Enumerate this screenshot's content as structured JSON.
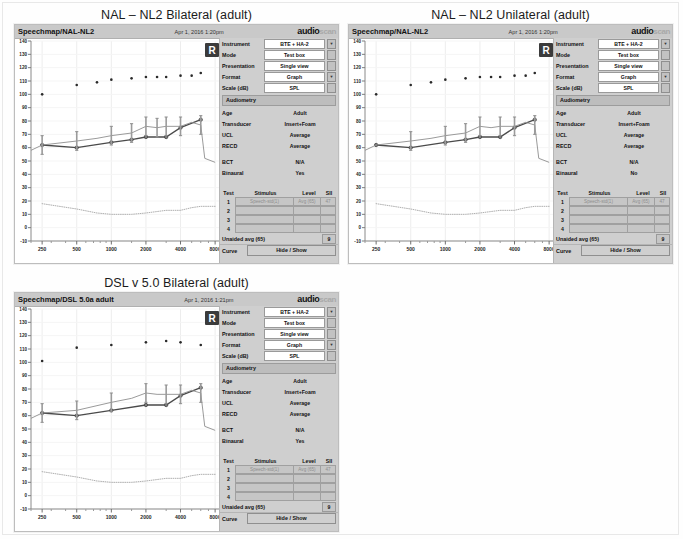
{
  "page": {
    "background": "#fefefe"
  },
  "panels": [
    {
      "id": "nal-nl2-bilateral",
      "title": "NAL – NL2 Bilateral (adult)",
      "titlebar": {
        "left": "Speechmap/NAL-NL2",
        "timestamp": "Apr 1, 2016 1:20pm"
      },
      "logo": {
        "audio": "audio",
        "scan": "scan"
      },
      "ear_badge": "R",
      "controls": [
        {
          "label": "Instrument",
          "value": "BTE + HA-2",
          "dropdown": true
        },
        {
          "label": "Mode",
          "value": "Test box",
          "dropdown": false
        },
        {
          "label": "Presentation",
          "value": "Single view",
          "dropdown": false
        },
        {
          "label": "Format",
          "value": "Graph",
          "dropdown": true
        },
        {
          "label": "Scale (dB)",
          "value": "SPL",
          "dropdown": false
        }
      ],
      "audiometry_header": "Audiometry",
      "audiometry": [
        {
          "label": "Age",
          "value": "Adult"
        },
        {
          "label": "Transducer",
          "value": "Insert+Foam"
        },
        {
          "label": "UCL",
          "value": "Average"
        },
        {
          "label": "RECD",
          "value": "Average"
        }
      ],
      "audiometry2": [
        {
          "label": "BCT",
          "value": "N/A"
        },
        {
          "label": "Binaural",
          "value": "Yes"
        }
      ],
      "test_table": {
        "headers": [
          "Test",
          "Stimulus",
          "Level",
          "SII"
        ],
        "rows": [
          {
            "test": "1",
            "stimulus": "Speech-std(1)",
            "level": "Avg (65)",
            "sii": "47"
          },
          {
            "test": "2",
            "stimulus": "",
            "level": "",
            "sii": ""
          },
          {
            "test": "3",
            "stimulus": "",
            "level": "",
            "sii": ""
          },
          {
            "test": "4",
            "stimulus": "",
            "level": "",
            "sii": ""
          }
        ]
      },
      "unaided": {
        "label": "Unaided avg (65)",
        "value": "9"
      },
      "curve": {
        "label": "Curve",
        "button": "Hide / Show"
      }
    },
    {
      "id": "nal-nl2-unilateral",
      "title": "NAL – NL2 Unilateral (adult)",
      "titlebar": {
        "left": "Speechmap/NAL-NL2",
        "timestamp": "Apr 1, 2016 1:20pm"
      },
      "logo": {
        "audio": "audio",
        "scan": "scan"
      },
      "ear_badge": "R",
      "controls": [
        {
          "label": "Instrument",
          "value": "BTE + HA-2",
          "dropdown": true
        },
        {
          "label": "Mode",
          "value": "Test box",
          "dropdown": false
        },
        {
          "label": "Presentation",
          "value": "Single view",
          "dropdown": false
        },
        {
          "label": "Format",
          "value": "Graph",
          "dropdown": true
        },
        {
          "label": "Scale (dB)",
          "value": "SPL",
          "dropdown": false
        }
      ],
      "audiometry_header": "Audiometry",
      "audiometry": [
        {
          "label": "Age",
          "value": "Adult"
        },
        {
          "label": "Transducer",
          "value": "Insert+Foam"
        },
        {
          "label": "UCL",
          "value": "Average"
        },
        {
          "label": "RECD",
          "value": "Average"
        }
      ],
      "audiometry2": [
        {
          "label": "BCT",
          "value": "N/A"
        },
        {
          "label": "Binaural",
          "value": "No"
        }
      ],
      "test_table": {
        "headers": [
          "Test",
          "Stimulus",
          "Level",
          "SII"
        ],
        "rows": [
          {
            "test": "1",
            "stimulus": "Speech-std(1)",
            "level": "Avg (65)",
            "sii": "47"
          },
          {
            "test": "2",
            "stimulus": "",
            "level": "",
            "sii": ""
          },
          {
            "test": "3",
            "stimulus": "",
            "level": "",
            "sii": ""
          },
          {
            "test": "4",
            "stimulus": "",
            "level": "",
            "sii": ""
          }
        ]
      },
      "unaided": {
        "label": "Unaided avg (65)",
        "value": "9"
      },
      "curve": {
        "label": "Curve",
        "button": "Hide / Show"
      }
    },
    {
      "id": "dsl-v5-bilateral",
      "title": "DSL v 5.0 Bilateral (adult)",
      "titlebar": {
        "left": "Speechmap/DSL 5.0a adult",
        "timestamp": "Apr 1, 2016 1:21pm"
      },
      "logo": {
        "audio": "audio",
        "scan": "scan"
      },
      "ear_badge": "R",
      "controls": [
        {
          "label": "Instrument",
          "value": "BTE + HA-2",
          "dropdown": true
        },
        {
          "label": "Mode",
          "value": "Test box",
          "dropdown": false
        },
        {
          "label": "Presentation",
          "value": "Single view",
          "dropdown": false
        },
        {
          "label": "Format",
          "value": "Graph",
          "dropdown": true
        },
        {
          "label": "Scale (dB)",
          "value": "SPL",
          "dropdown": false
        }
      ],
      "audiometry_header": "Audiometry",
      "audiometry": [
        {
          "label": "Age",
          "value": "Adult"
        },
        {
          "label": "Transducer",
          "value": "Insert+Foam"
        },
        {
          "label": "UCL",
          "value": "Average"
        },
        {
          "label": "RECD",
          "value": "Average"
        }
      ],
      "audiometry2": [
        {
          "label": "BCT",
          "value": "N/A"
        },
        {
          "label": "Binaural",
          "value": "Yes"
        }
      ],
      "test_table": {
        "headers": [
          "Test",
          "Stimulus",
          "Level",
          "SII"
        ],
        "rows": [
          {
            "test": "1",
            "stimulus": "Speech-std(1)",
            "level": "Avg (65)",
            "sii": "47"
          },
          {
            "test": "2",
            "stimulus": "",
            "level": "",
            "sii": ""
          },
          {
            "test": "3",
            "stimulus": "",
            "level": "",
            "sii": ""
          },
          {
            "test": "4",
            "stimulus": "",
            "level": "",
            "sii": ""
          }
        ]
      },
      "unaided": {
        "label": "Unaided avg (65)",
        "value": "9"
      },
      "curve": {
        "label": "Curve",
        "button": "Hide / Show"
      }
    }
  ],
  "chart_data": [
    {
      "type": "line",
      "id": "nal-nl2-bilateral",
      "title": "NAL – NL2 Bilateral (adult)",
      "xlabel": "Frequency (Hz)",
      "ylabel": "dB SPL",
      "xscale": "log",
      "xlim": [
        200,
        9000
      ],
      "ylim": [
        -10,
        140
      ],
      "yticks": [
        -10,
        0,
        10,
        20,
        30,
        40,
        50,
        60,
        70,
        80,
        90,
        100,
        110,
        120,
        130,
        140
      ],
      "xticks": [
        250,
        500,
        1000,
        2000,
        4000,
        8000
      ],
      "grid": true,
      "legend": "none",
      "series": [
        {
          "name": "UCL (upper limit dots)",
          "style": "dots",
          "color": "#2a2a2a",
          "x": [
            250,
            500,
            750,
            1000,
            1500,
            2000,
            2500,
            3000,
            4000,
            5000,
            6000
          ],
          "y": [
            100,
            107,
            109,
            111,
            112,
            113,
            113,
            113,
            114,
            114,
            116
          ]
        },
        {
          "name": "Aided speech output (dark)",
          "style": "line+markers",
          "color": "#4a4a4a",
          "x": [
            250,
            500,
            1000,
            1500,
            2000,
            3000,
            4000,
            6000
          ],
          "y": [
            62,
            60,
            64,
            66,
            68,
            68,
            75,
            81
          ]
        },
        {
          "name": "Prescription target (light)",
          "style": "line",
          "color": "#8f8f8f",
          "x": [
            200,
            250,
            500,
            750,
            1000,
            1500,
            2000,
            2500,
            3000,
            4000,
            5000,
            6000,
            6500,
            8000
          ],
          "y": [
            58,
            62,
            65,
            67,
            69,
            71,
            76,
            75,
            76,
            76,
            79,
            77,
            52,
            49
          ]
        },
        {
          "name": "Unaided / noise floor (dotted)",
          "style": "dotted",
          "color": "#b0b0b0",
          "x": [
            250,
            500,
            750,
            1000,
            1500,
            2000,
            3000,
            4000,
            5000,
            6000,
            8000
          ],
          "y": [
            18,
            14,
            11,
            10,
            10,
            11,
            13,
            13,
            15,
            16,
            16
          ]
        }
      ],
      "markers_vertical_bars": [
        250,
        500,
        1000,
        1500,
        2000,
        2500,
        3000,
        4000,
        6000
      ]
    },
    {
      "type": "line",
      "id": "nal-nl2-unilateral",
      "title": "NAL – NL2 Unilateral (adult)",
      "xlabel": "Frequency (Hz)",
      "ylabel": "dB SPL",
      "xscale": "log",
      "xlim": [
        200,
        9000
      ],
      "ylim": [
        -10,
        140
      ],
      "yticks": [
        -10,
        0,
        10,
        20,
        30,
        40,
        50,
        60,
        70,
        80,
        90,
        100,
        110,
        120,
        130,
        140
      ],
      "xticks": [
        250,
        500,
        1000,
        2000,
        4000,
        8000
      ],
      "grid": true,
      "legend": "none",
      "series": [
        {
          "name": "UCL (upper limit dots)",
          "style": "dots",
          "color": "#2a2a2a",
          "x": [
            250,
            500,
            750,
            1000,
            1500,
            2000,
            2500,
            3000,
            4000,
            5000,
            6000
          ],
          "y": [
            100,
            107,
            109,
            111,
            112,
            113,
            113,
            113,
            114,
            114,
            116
          ]
        },
        {
          "name": "Aided speech output (dark)",
          "style": "line+markers",
          "color": "#4a4a4a",
          "x": [
            250,
            500,
            1000,
            1500,
            2000,
            3000,
            4000,
            6000
          ],
          "y": [
            62,
            60,
            64,
            66,
            68,
            68,
            75,
            81
          ]
        },
        {
          "name": "Prescription target (light)",
          "style": "line",
          "color": "#8f8f8f",
          "x": [
            200,
            250,
            500,
            750,
            1000,
            1500,
            2000,
            2500,
            3000,
            4000,
            5000,
            6000,
            6500,
            8000
          ],
          "y": [
            58,
            62,
            65,
            67,
            69,
            71,
            76,
            75,
            76,
            76,
            79,
            77,
            52,
            49
          ]
        },
        {
          "name": "Unaided / noise floor (dotted)",
          "style": "dotted",
          "color": "#b0b0b0",
          "x": [
            250,
            500,
            750,
            1000,
            1500,
            2000,
            3000,
            4000,
            5000,
            6000,
            8000
          ],
          "y": [
            18,
            14,
            11,
            10,
            10,
            11,
            13,
            13,
            15,
            16,
            16
          ]
        }
      ],
      "markers_vertical_bars": [
        500,
        1000,
        1500,
        2000,
        3000,
        4000,
        6000
      ]
    },
    {
      "type": "line",
      "id": "dsl-v5-bilateral",
      "title": "DSL v 5.0 Bilateral (adult)",
      "xlabel": "Frequency (Hz)",
      "ylabel": "dB SPL",
      "xscale": "log",
      "xlim": [
        200,
        9000
      ],
      "ylim": [
        -10,
        140
      ],
      "yticks": [
        -10,
        0,
        10,
        20,
        30,
        40,
        50,
        60,
        70,
        80,
        90,
        100,
        110,
        120,
        130,
        140
      ],
      "xticks": [
        250,
        500,
        1000,
        2000,
        4000,
        8000
      ],
      "grid": true,
      "legend": "none",
      "series": [
        {
          "name": "UCL (upper limit dots)",
          "style": "dots",
          "color": "#2a2a2a",
          "x": [
            250,
            500,
            1000,
            2000,
            3000,
            4000,
            6000
          ],
          "y": [
            101,
            111,
            113,
            115,
            116,
            115,
            113
          ]
        },
        {
          "name": "Aided speech output (dark)",
          "style": "line+markers",
          "color": "#4a4a4a",
          "x": [
            250,
            500,
            1000,
            2000,
            3000,
            4000,
            6000
          ],
          "y": [
            62,
            60,
            64,
            68,
            68,
            75,
            81
          ]
        },
        {
          "name": "Prescription target (light)",
          "style": "line",
          "color": "#8f8f8f",
          "x": [
            200,
            250,
            500,
            1000,
            1500,
            2000,
            2500,
            3000,
            4000,
            5000,
            6000,
            6500,
            8000
          ],
          "y": [
            58,
            62,
            64,
            70,
            73,
            77,
            76,
            76,
            76,
            79,
            77,
            52,
            49
          ]
        },
        {
          "name": "Unaided / noise floor (dotted)",
          "style": "dotted",
          "color": "#b0b0b0",
          "x": [
            250,
            500,
            750,
            1000,
            1500,
            2000,
            3000,
            4000,
            5000,
            6000,
            8000
          ],
          "y": [
            18,
            14,
            11,
            10,
            10,
            11,
            13,
            13,
            15,
            16,
            16
          ]
        }
      ],
      "markers_vertical_bars": [
        250,
        500,
        1000,
        2000,
        3000,
        4000,
        6000
      ]
    }
  ]
}
